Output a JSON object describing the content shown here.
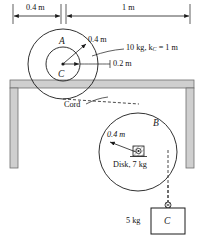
{
  "diagram": {
    "colors": {
      "line": "#1a1a1a",
      "wall_fill": "#cfcfcf",
      "wall_edge": "#6e6e6e",
      "background": "#ffffff"
    },
    "dimensions": {
      "left_span_label": "0.4 m",
      "right_span_label": "1 m"
    },
    "wheel_a": {
      "body_label": "A",
      "center_label": "C",
      "outer_radius_label": "0.4 m",
      "inner_radius_label": "0.2 m",
      "mass_property_label": "10 kg, k",
      "mass_property_sub": "C",
      "mass_property_tail": " = 1 m"
    },
    "cord": {
      "label": "Cord"
    },
    "disk_b": {
      "body_label": "B",
      "radius_label": "0.4 m",
      "mass_label": "Disk, 7 kg"
    },
    "block_c": {
      "mass_label": "5 kg",
      "body_label": "C"
    }
  }
}
